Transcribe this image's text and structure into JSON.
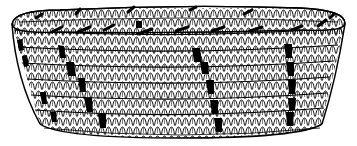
{
  "illustration": {
    "subject": "coiled basket line drawing",
    "colors": {
      "background": "#ffffff",
      "ink": "#000000"
    },
    "coil_rows": 6,
    "design_stripes": 4
  }
}
